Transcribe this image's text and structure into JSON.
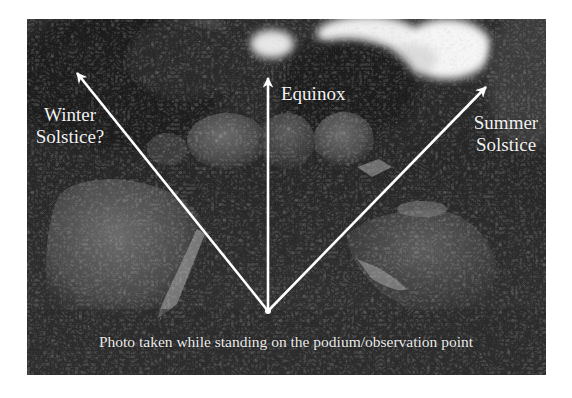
{
  "figure": {
    "labels": {
      "winter_line1": "Winter",
      "winter_line2": "Solstice?",
      "equinox": "Equinox",
      "summer_line1": "Summer",
      "summer_line2": "Solstice"
    },
    "caption": "Photo taken while standing on the podium/observation point",
    "arrows": [
      {
        "name": "winter-solstice",
        "from": [
          268,
          311
        ],
        "to": [
          77,
          73
        ]
      },
      {
        "name": "equinox",
        "from": [
          268,
          311
        ],
        "to": [
          268,
          78
        ]
      },
      {
        "name": "summer-solstice",
        "from": [
          268,
          311
        ],
        "to": [
          486,
          87
        ]
      }
    ],
    "colors": {
      "arrow": "#ffffff",
      "label_text": "#f2f2f2",
      "photo_dark": "#1e1e1e",
      "photo_mid": "#4a4a4a",
      "sky": "#f4f4f4"
    }
  }
}
